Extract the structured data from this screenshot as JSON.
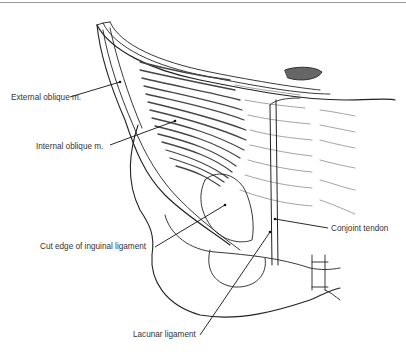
{
  "figure": {
    "labels": [
      {
        "id": "external-oblique",
        "text": "External oblique m."
      },
      {
        "id": "internal-oblique",
        "text": "Internal oblique m."
      },
      {
        "id": "cut-edge-inguinal",
        "text": "Cut edge of inguinal ligament"
      },
      {
        "id": "lacunar-ligament",
        "text": "Lacunar ligament"
      },
      {
        "id": "conjoint-tendon",
        "text": "Conjoint tendon"
      }
    ]
  },
  "colors": {
    "line": "#222222",
    "muscle_fill": "#555555",
    "text": "#333333",
    "background": "#ffffff"
  }
}
